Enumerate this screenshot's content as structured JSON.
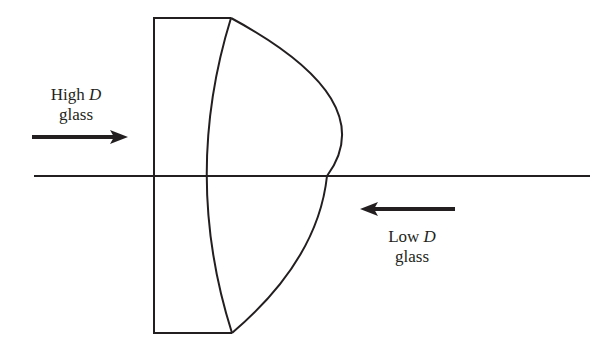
{
  "diagram": {
    "type": "lens cross-section (cemented doublet)",
    "colors": {
      "stroke": "#231f20",
      "background": "#ffffff"
    },
    "labels": {
      "high": {
        "line1_prefix": "High ",
        "line1_var": "D",
        "line2": "glass"
      },
      "low": {
        "line1_prefix": "Low ",
        "line1_var": "D",
        "line2": "glass"
      }
    },
    "arrows": [
      {
        "name": "high-d-arrow",
        "direction": "right"
      },
      {
        "name": "low-d-arrow",
        "direction": "left"
      }
    ]
  }
}
